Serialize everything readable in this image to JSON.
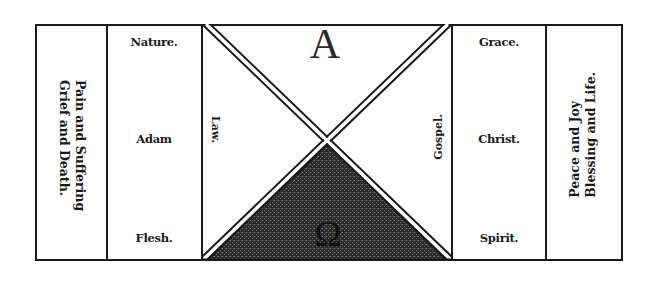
{
  "diagram": {
    "left_outer": {
      "line1": "Pain and Suffering",
      "line2": "Grief and Death."
    },
    "left_inner": {
      "top": "Nature.",
      "middle": "Adam",
      "bottom": "Flesh."
    },
    "center": {
      "top_letter": "A",
      "bottom_letter": "Ω",
      "left_label": "Law.",
      "right_label": "Gospel."
    },
    "right_inner": {
      "top": "Grace.",
      "middle": "Christ.",
      "bottom": "Spirit."
    },
    "right_outer": {
      "line1": "Peace and Joy",
      "line2": "Blessing and Life."
    },
    "colors": {
      "ink": "#1a1a1a",
      "shaded_triangle": "#3a3a3a",
      "paper": "#ffffff"
    }
  }
}
